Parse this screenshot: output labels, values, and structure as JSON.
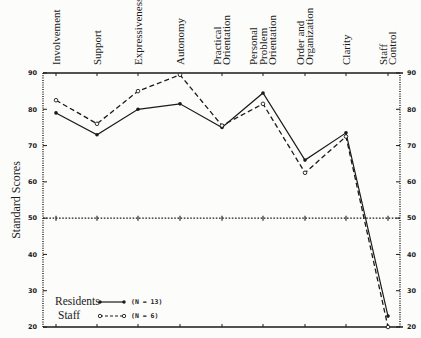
{
  "chart_data": {
    "type": "line",
    "title": "",
    "xlabel": "",
    "ylabel": "Standard Scores",
    "ylim": [
      20,
      90
    ],
    "yticks": [
      20,
      30,
      40,
      50,
      60,
      70,
      80,
      90
    ],
    "reference_line": 50,
    "grid": false,
    "legend_position": "lower-left",
    "categories": [
      [
        "Involvement"
      ],
      [
        "Support"
      ],
      [
        "Expressiveness"
      ],
      [
        "Autonomy"
      ],
      [
        "Practical",
        "Orientation"
      ],
      [
        "Personal",
        "Problem",
        "Orientation"
      ],
      [
        "Order and",
        "Organization"
      ],
      [
        "Clarity"
      ],
      [
        "Staff",
        "Control"
      ]
    ],
    "series": [
      {
        "name": "Residents",
        "n_label": "(N = 13)",
        "style": "solid",
        "marker": "filled",
        "values": [
          79,
          73,
          80,
          81.5,
          75,
          84.5,
          66,
          73.5,
          23
        ]
      },
      {
        "name": "Staff",
        "n_label": "(N = 6)",
        "style": "dashed",
        "marker": "open",
        "values": [
          82.5,
          76,
          85,
          89.5,
          75.5,
          81.5,
          62.5,
          72.5,
          20
        ]
      }
    ]
  },
  "colors": {
    "ink": "#1a1a1a",
    "background": "#fcfcfa"
  }
}
